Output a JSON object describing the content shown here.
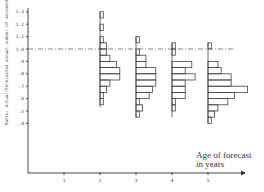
{
  "chart_data": {
    "type": "histogram",
    "title": "",
    "xlabel": "Age of forecast in years",
    "xlabel_lines": [
      "Age of forecast",
      "in years"
    ],
    "ylabel": "Ratio: Actual/Forecasted annual number of movements",
    "x_ticks": [
      "1",
      "2",
      "3",
      "4",
      "5"
    ],
    "y_ticks": [
      "1.3",
      "1.2",
      "1.1",
      "1.0",
      ".9",
      ".8",
      ".7",
      ".6",
      ".5",
      ".4"
    ],
    "y_tick_values": [
      1.3,
      1.2,
      1.1,
      1.0,
      0.9,
      0.8,
      0.7,
      0.6,
      0.5,
      0.4
    ],
    "ylim": [
      0.0,
      1.35
    ],
    "xlim": [
      0,
      6
    ],
    "reference_line": {
      "y": 1.0,
      "style": "dash-dot"
    },
    "grid": false,
    "bin_width": 0.05,
    "series": [
      {
        "name": "Age 2",
        "x": 2,
        "bins": [
          {
            "from": 1.25,
            "to": 1.3,
            "count": 1
          },
          {
            "from": 1.15,
            "to": 1.2,
            "count": 1
          },
          {
            "from": 1.05,
            "to": 1.1,
            "count": 1
          },
          {
            "from": 1.0,
            "to": 1.05,
            "count": 2
          },
          {
            "from": 0.95,
            "to": 1.0,
            "count": 2
          },
          {
            "from": 0.9,
            "to": 0.95,
            "count": 3
          },
          {
            "from": 0.85,
            "to": 0.9,
            "count": 5
          },
          {
            "from": 0.8,
            "to": 0.85,
            "count": 6
          },
          {
            "from": 0.75,
            "to": 0.8,
            "count": 6
          },
          {
            "from": 0.7,
            "to": 0.75,
            "count": 3
          },
          {
            "from": 0.65,
            "to": 0.7,
            "count": 2
          },
          {
            "from": 0.6,
            "to": 0.65,
            "count": 1
          },
          {
            "from": 0.55,
            "to": 0.6,
            "count": 1
          }
        ],
        "range": [
          0.53,
          1.3
        ]
      },
      {
        "name": "Age 3",
        "x": 3,
        "bins": [
          {
            "from": 1.05,
            "to": 1.1,
            "count": 1
          },
          {
            "from": 0.95,
            "to": 1.0,
            "count": 1
          },
          {
            "from": 0.9,
            "to": 0.95,
            "count": 3
          },
          {
            "from": 0.85,
            "to": 0.9,
            "count": 3
          },
          {
            "from": 0.8,
            "to": 0.85,
            "count": 6
          },
          {
            "from": 0.75,
            "to": 0.8,
            "count": 6
          },
          {
            "from": 0.7,
            "to": 0.75,
            "count": 6
          },
          {
            "from": 0.65,
            "to": 0.7,
            "count": 5
          },
          {
            "from": 0.6,
            "to": 0.65,
            "count": 4
          },
          {
            "from": 0.55,
            "to": 0.6,
            "count": 1
          },
          {
            "from": 0.5,
            "to": 0.55,
            "count": 2
          },
          {
            "from": 0.45,
            "to": 0.5,
            "count": 1
          }
        ],
        "range": [
          0.45,
          1.1
        ]
      },
      {
        "name": "Age 4",
        "x": 4,
        "bins": [
          {
            "from": 1.0,
            "to": 1.05,
            "count": 1
          },
          {
            "from": 0.95,
            "to": 1.0,
            "count": 1
          },
          {
            "from": 0.85,
            "to": 0.9,
            "count": 6
          },
          {
            "from": 0.8,
            "to": 0.85,
            "count": 4
          },
          {
            "from": 0.75,
            "to": 0.8,
            "count": 7
          },
          {
            "from": 0.7,
            "to": 0.75,
            "count": 4
          },
          {
            "from": 0.65,
            "to": 0.7,
            "count": 4
          },
          {
            "from": 0.6,
            "to": 0.65,
            "count": 4
          },
          {
            "from": 0.55,
            "to": 0.6,
            "count": 1
          },
          {
            "from": 0.5,
            "to": 0.55,
            "count": 1
          }
        ],
        "range": [
          0.45,
          1.05
        ]
      },
      {
        "name": "Age 5",
        "x": 5,
        "bins": [
          {
            "from": 1.0,
            "to": 1.05,
            "count": 1
          },
          {
            "from": 0.85,
            "to": 0.9,
            "count": 3
          },
          {
            "from": 0.8,
            "to": 0.85,
            "count": 4
          },
          {
            "from": 0.75,
            "to": 0.8,
            "count": 7
          },
          {
            "from": 0.7,
            "to": 0.75,
            "count": 7
          },
          {
            "from": 0.65,
            "to": 0.7,
            "count": 12
          },
          {
            "from": 0.6,
            "to": 0.65,
            "count": 8
          },
          {
            "from": 0.55,
            "to": 0.6,
            "count": 6
          },
          {
            "from": 0.5,
            "to": 0.55,
            "count": 3
          },
          {
            "from": 0.45,
            "to": 0.5,
            "count": 2
          },
          {
            "from": 0.4,
            "to": 0.45,
            "count": 1
          }
        ],
        "range": [
          0.4,
          1.05
        ]
      }
    ]
  }
}
